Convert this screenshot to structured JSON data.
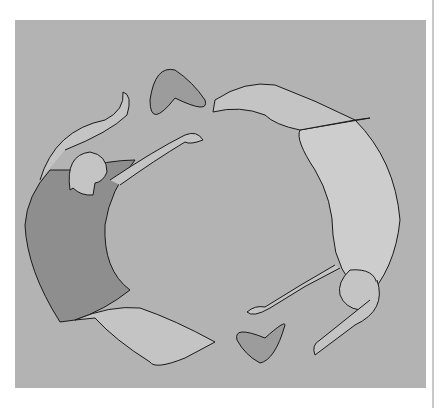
{
  "illustration": {
    "subject": "two figures reaching toward each other in a circle with two hearts",
    "colors": {
      "background": "#ffffff",
      "panel": "#b3b3b3",
      "dark_shirt": "#8e8e8e",
      "light_shirt": "#cdcdcd",
      "skin": "#c4c4c4",
      "heart": "#9c9c9c",
      "outline": "#1a1a1a"
    }
  }
}
